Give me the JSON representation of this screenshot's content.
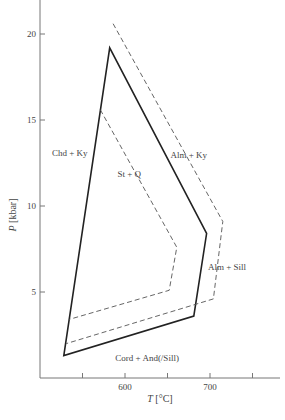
{
  "chart_data": {
    "type": "line",
    "title": "",
    "xlabel": "T [°C]",
    "ylabel": "P [kbar]",
    "xlim": [
      500,
      775
    ],
    "ylim": [
      0,
      22
    ],
    "xticks": [
      550,
      600,
      650,
      700,
      750
    ],
    "xtick_labels": [
      "",
      "600",
      "",
      "700",
      ""
    ],
    "yticks": [
      5,
      10,
      15,
      20
    ],
    "ytick_labels": [
      "5",
      "10",
      "15",
      "20"
    ],
    "grid": false,
    "legend": null,
    "series": [
      {
        "name": "solid-field-boundary",
        "style": "solid",
        "closed": true,
        "points": [
          [
            528,
            1.3
          ],
          [
            582,
            19.2
          ],
          [
            696,
            8.4
          ],
          [
            681,
            3.6
          ]
        ]
      },
      {
        "name": "outer-dashed-boundary",
        "style": "dashed",
        "closed": false,
        "points": [
          [
            586,
            20.6
          ],
          [
            715,
            9.1
          ],
          [
            704,
            4.6
          ],
          [
            531,
            2.0
          ]
        ]
      },
      {
        "name": "inner-dashed-boundary",
        "style": "dashed",
        "closed": false,
        "points": [
          [
            571,
            15.6
          ],
          [
            661,
            7.6
          ],
          [
            652,
            5.1
          ],
          [
            534,
            3.4
          ]
        ]
      }
    ],
    "annotations": [
      {
        "text": "Chd + Ky",
        "x": 535,
        "y": 12.9
      },
      {
        "text": "St + Q",
        "x": 605,
        "y": 11.7
      },
      {
        "text": "Alm + Ky",
        "x": 675,
        "y": 12.8
      },
      {
        "text": "Alm + Sill",
        "x": 720,
        "y": 6.3
      },
      {
        "text": "Cord + And(/Sill)",
        "x": 626,
        "y": 1.0
      }
    ]
  },
  "axes": {
    "x_label_main": "T",
    "x_label_unit": " [°C]",
    "y_label_main": "P",
    "y_label_unit": " [kbar]"
  }
}
